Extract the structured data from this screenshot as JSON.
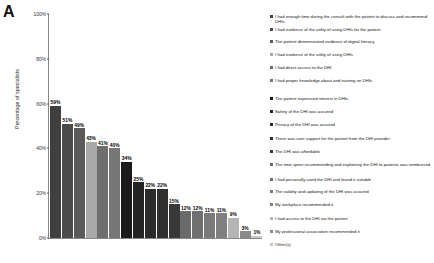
{
  "panel": {
    "label": "A"
  },
  "chart_data": {
    "type": "bar",
    "title": "",
    "xlabel": "",
    "ylabel": "Percentage of specialists",
    "ylim": [
      0,
      100
    ],
    "yticks": [
      0,
      20,
      40,
      60,
      80,
      100
    ],
    "ytick_labels": [
      "0%",
      "20%",
      "40%",
      "60%",
      "80%",
      "100%"
    ],
    "grid": false,
    "legend_position": "right",
    "categories": [
      "I had enough time during the consult with the patient to discuss and recommend DHIs",
      "I had evidence of the utility of using DHIs for the patient",
      "The patient demonstrated evidence of digital literacy",
      "I had evidence of the utility of using DHIs",
      "I had direct access to the DHI",
      "I had proper knowledge about and training on DHIs",
      "The patient expressed interest in DHIs",
      "Safety of the DHI  was assured",
      "Privacy of the DHI was assured",
      "There was user support for the patient from the DHI provider",
      "The DHI was affordable",
      "The time spent recommending and explaining the DHI to patients was reimbursed",
      "I had personally used the DHI and found it suitable",
      "The validity and updating of the DHI  was assured",
      "My workplace recommended it",
      "I had access to the DHI via the patient",
      "My professional association recommended it",
      "Other(s)"
    ],
    "values": [
      59,
      51,
      49,
      43,
      41,
      40,
      34,
      25,
      22,
      22,
      15,
      12,
      12,
      11,
      11,
      9,
      3,
      1
    ],
    "value_labels": [
      "59%",
      "51%",
      "49%",
      "43%",
      "41%",
      "40%",
      "34%",
      "25%",
      "22%",
      "22%",
      "15%",
      "12%",
      "12%",
      "11%",
      "11%",
      "9%",
      "3%",
      "1%"
    ],
    "colors": [
      "#3f3f3f",
      "#4b4b4b",
      "#5a5a5a",
      "#a8a8a8",
      "#6e6e6e",
      "#777777",
      "#1a1a1a",
      "#242424",
      "#2b2b2b",
      "#303030",
      "#383838",
      "#6a6a6a",
      "#6f6f6f",
      "#7a7a7a",
      "#808080",
      "#b5b5b5",
      "#8a8a8a",
      "#c9c9c9"
    ]
  }
}
